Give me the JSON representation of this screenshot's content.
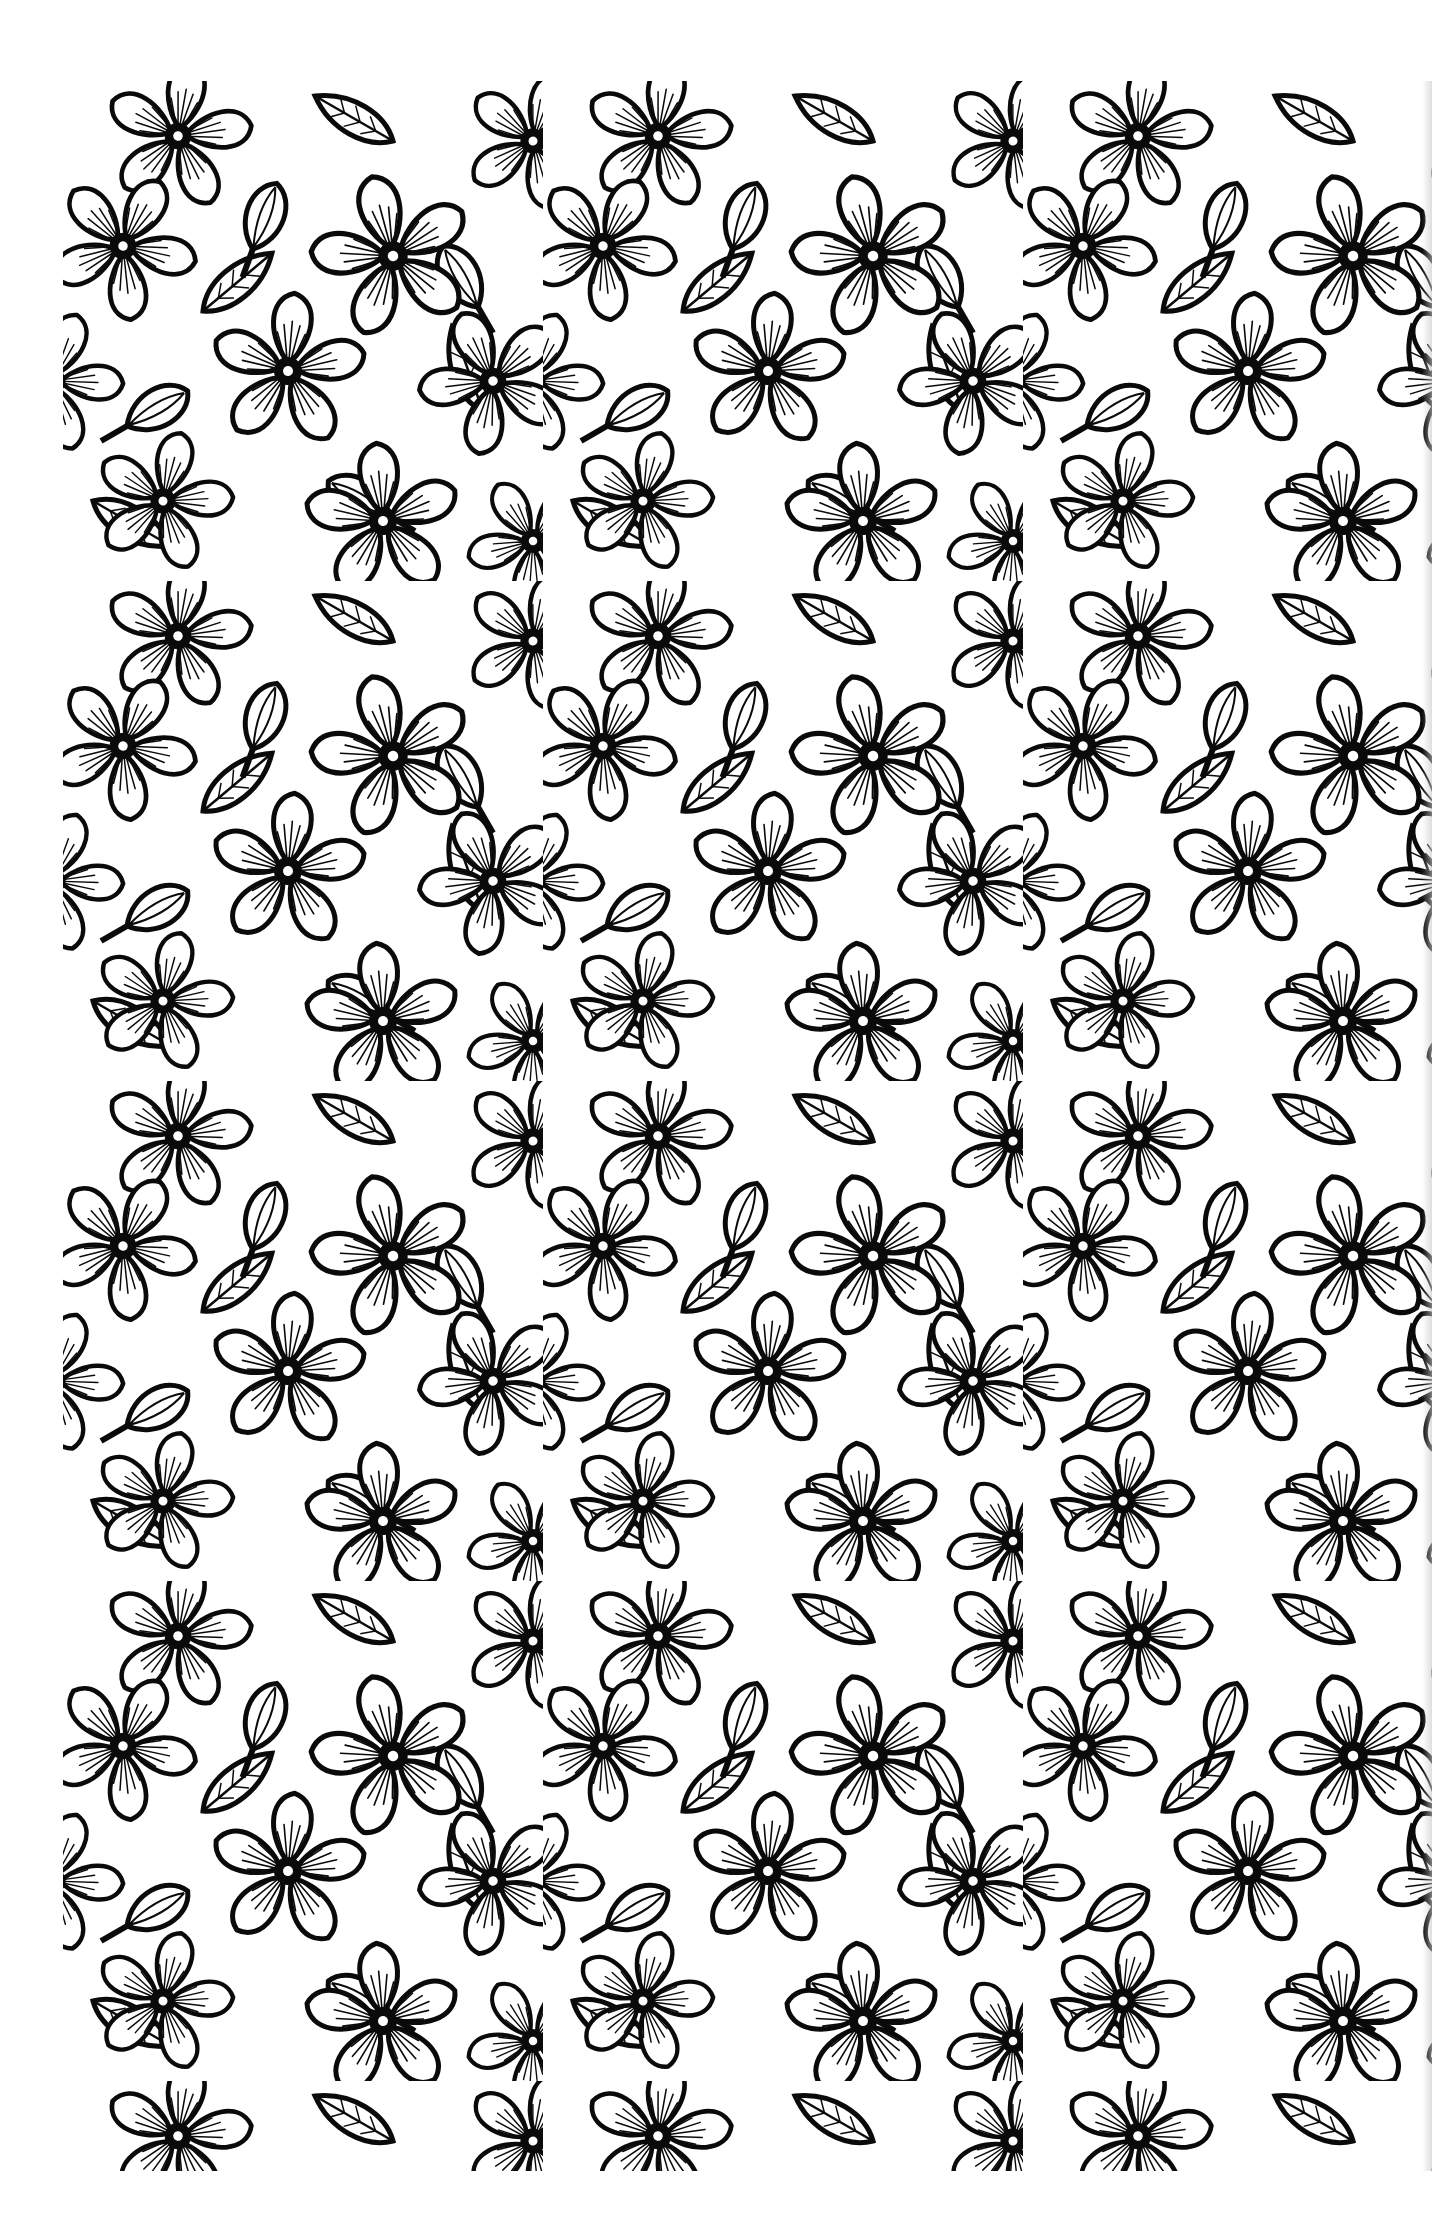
{
  "image": {
    "description": "Black and white floral coloring page with dense repeating pattern of five-petal flowers, buds and leaves",
    "colors": {
      "ink": "#0a0a0a",
      "paper": "#ffffff",
      "edge_shadow": "#c8c8c8"
    },
    "pattern_area": {
      "left": 63,
      "top": 81,
      "width": 1369,
      "height": 2090
    },
    "motifs": [
      "five-petal-flower",
      "flower-bud",
      "leaf",
      "stem"
    ]
  }
}
